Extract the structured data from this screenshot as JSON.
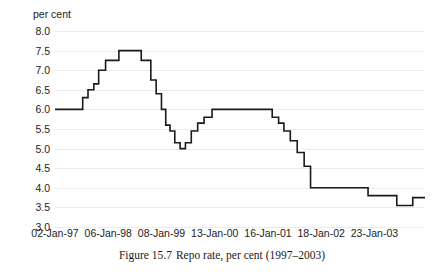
{
  "figure": {
    "unit_label": "per cent",
    "caption_number": "Figure 15.7",
    "caption_text": "Repo rate, per cent (1997–2003)"
  },
  "axis": {
    "y_ticks": [
      "8.0",
      "7.5",
      "7.0",
      "6.5",
      "6.0",
      "5.5",
      "5.0",
      "4.5",
      "4.0",
      "3.5",
      "3.0"
    ],
    "x_ticks": [
      "02-Jan-97",
      "06-Jan-98",
      "08-Jan-99",
      "13-Jan-00",
      "16-Jan-01",
      "18-Jan-02",
      "23-Jan-03"
    ]
  },
  "chart_data": {
    "type": "line",
    "title": "Repo rate, per cent (1997–2003)",
    "xlabel": "",
    "ylabel": "per cent",
    "ylim": [
      3.0,
      8.0
    ],
    "xlim": [
      1997.0,
      2003.95
    ],
    "grid": true,
    "legend": null,
    "line_style": "step-post",
    "line_color": "#1a1a1a",
    "categories": [
      "02-Jan-97",
      "06-Jan-98",
      "08-Jan-99",
      "13-Jan-00",
      "16-Jan-01",
      "18-Jan-02",
      "23-Jan-03"
    ],
    "category_x": [
      1997.0,
      1998.0,
      1999.0,
      2000.0,
      2001.0,
      2002.0,
      2003.0
    ],
    "series": [
      {
        "name": "Repo rate",
        "x": [
          1997.0,
          1997.52,
          1997.62,
          1997.73,
          1997.82,
          1997.95,
          1998.2,
          1998.62,
          1998.8,
          1998.9,
          1999.0,
          1999.08,
          1999.16,
          1999.25,
          1999.35,
          1999.45,
          1999.56,
          1999.68,
          1999.8,
          1999.95,
          2000.12,
          2001.08,
          2001.2,
          2001.3,
          2001.42,
          2001.55,
          2001.68,
          2001.8,
          2002.88,
          2003.42,
          2003.72,
          2003.95
        ],
        "y": [
          6.0,
          6.3,
          6.5,
          6.65,
          7.0,
          7.25,
          7.5,
          7.25,
          6.75,
          6.4,
          6.0,
          5.6,
          5.45,
          5.15,
          5.0,
          5.15,
          5.45,
          5.65,
          5.8,
          6.0,
          6.0,
          5.8,
          5.65,
          5.45,
          5.2,
          4.9,
          4.55,
          4.0,
          3.8,
          3.55,
          3.75,
          3.75
        ]
      }
    ]
  }
}
